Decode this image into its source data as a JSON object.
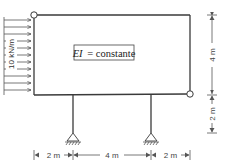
{
  "diagram": {
    "type": "structural-frame",
    "load": {
      "label": "10 kN/m",
      "direction": "horizontal-right",
      "applied_to": "left-column"
    },
    "stiffness_label": "EI = constante",
    "stiffness_symbol": "EI",
    "stiffness_text": "= constante",
    "supports": [
      {
        "name": "left-pin-support",
        "type": "pin"
      },
      {
        "name": "right-pin-support",
        "type": "pin"
      }
    ],
    "hinges": [
      {
        "name": "top-left-hinge"
      },
      {
        "name": "bottom-right-hinge"
      }
    ],
    "dimensions": {
      "vertical": [
        {
          "label": "4 m"
        },
        {
          "label": "2 m"
        }
      ],
      "horizontal": [
        {
          "label": "2 m"
        },
        {
          "label": "4 m"
        },
        {
          "label": "2 m"
        }
      ]
    },
    "colors": {
      "line": "#3a3a3a",
      "text": "#333333",
      "background": "#ffffff"
    }
  }
}
